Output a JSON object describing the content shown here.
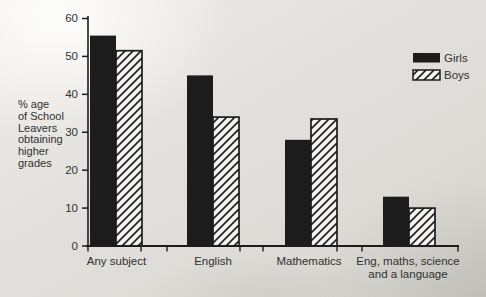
{
  "page": {
    "kind": "scanned statistics bar chart"
  },
  "colors": {
    "ink": "#1c1c1c",
    "text": "#30302e",
    "paper_white": "#f4f3f0",
    "background": "#dedcd8"
  },
  "legend": {
    "items": [
      {
        "label": "Girls",
        "swatch": "solid-black"
      },
      {
        "label": "Boys",
        "swatch": "diagonal-hatch"
      }
    ]
  },
  "chart_data": {
    "type": "bar",
    "title": "",
    "xlabel": "",
    "ylabel": "% age of School Leavers obtaining higher grades",
    "ylabel_lines": [
      "% age",
      "of School",
      "Leavers",
      "obtaining",
      "higher",
      "grades"
    ],
    "categories": [
      "Any subject",
      "English",
      "Mathematics",
      "Eng, maths, science and a language"
    ],
    "category_label_lines": [
      [
        "Any subject"
      ],
      [
        "English"
      ],
      [
        "Mathematics"
      ],
      [
        "Eng, maths, science",
        "and a language"
      ]
    ],
    "series": [
      {
        "name": "Girls",
        "style": "solid-black",
        "values": [
          55.5,
          45,
          28,
          13
        ]
      },
      {
        "name": "Boys",
        "style": "diagonal-hatch",
        "values": [
          51.5,
          34,
          33.5,
          10
        ]
      }
    ],
    "yticks": [
      0,
      10,
      20,
      30,
      40,
      50,
      60
    ],
    "ylim": [
      0,
      60
    ],
    "grid": false,
    "legend_position": "upper-right"
  }
}
